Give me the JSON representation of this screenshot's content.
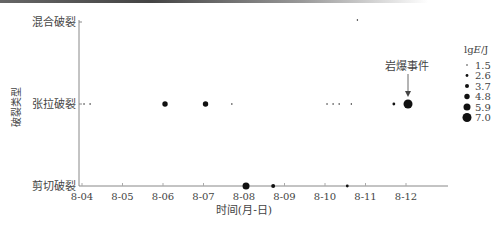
{
  "chart_data": {
    "type": "scatter",
    "title": "",
    "xlabel": "时间(月-日)",
    "ylabel": "破裂类型",
    "x_ticks": [
      "8-04",
      "8-05",
      "8-06",
      "8-07",
      "8-08",
      "8-09",
      "8-10",
      "8-11",
      "8-12"
    ],
    "y_categories": [
      "剪切破裂",
      "张拉破裂",
      "混合破裂"
    ],
    "legend": {
      "title": "lgE/J",
      "entries": [
        "1.5",
        "2.6",
        "3.7",
        "4.8",
        "5.9",
        "7.0"
      ],
      "position": "right"
    },
    "annotation": {
      "text": "岩爆事件",
      "x": "8-12",
      "y": "张拉破裂"
    },
    "points": [
      {
        "x": 4.05,
        "y": "张拉破裂",
        "lgE": 1.5
      },
      {
        "x": 4.2,
        "y": "张拉破裂",
        "lgE": 1.5
      },
      {
        "x": 6.05,
        "y": "张拉破裂",
        "lgE": 4.8
      },
      {
        "x": 7.05,
        "y": "张拉破裂",
        "lgE": 4.8
      },
      {
        "x": 7.7,
        "y": "张拉破裂",
        "lgE": 1.5
      },
      {
        "x": 10.05,
        "y": "张拉破裂",
        "lgE": 1.5
      },
      {
        "x": 10.2,
        "y": "张拉破裂",
        "lgE": 1.5
      },
      {
        "x": 10.35,
        "y": "张拉破裂",
        "lgE": 1.5
      },
      {
        "x": 10.65,
        "y": "张拉破裂",
        "lgE": 1.5
      },
      {
        "x": 11.7,
        "y": "张拉破裂",
        "lgE": 2.6
      },
      {
        "x": 12.05,
        "y": "张拉破裂",
        "lgE": 7.0
      },
      {
        "x": 10.8,
        "y": "混合破裂",
        "lgE": 1.5
      },
      {
        "x": 8.05,
        "y": "剪切破裂",
        "lgE": 5.9
      },
      {
        "x": 8.72,
        "y": "剪切破裂",
        "lgE": 3.7
      },
      {
        "x": 10.55,
        "y": "剪切破裂",
        "lgE": 2.6
      }
    ],
    "grid": false
  },
  "labels": {
    "y_cat_mixed": "混合破裂",
    "y_cat_tension": "张拉破裂",
    "y_cat_shear": "剪切破裂",
    "ylabel": "破裂类型",
    "xlabel": "时间(月-日)",
    "annotation": "岩爆事件",
    "legend_title_prefix": "lg",
    "legend_title_var": "E",
    "legend_title_unit": "/J"
  }
}
